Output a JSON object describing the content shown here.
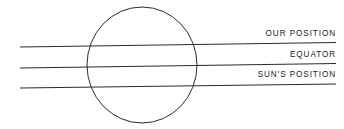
{
  "diagram": {
    "type": "astronomy-schematic",
    "background_color": "#ffffff",
    "stroke_color": "#2b2b2b",
    "text_color": "#222222",
    "width": 344,
    "height": 129,
    "earth_circle": {
      "name": "earth",
      "center_x": 142,
      "center_y": 65,
      "radius_x": 55,
      "radius_y": 58,
      "stroke_width": 1
    },
    "lines": [
      {
        "id": "our-position-line",
        "label": "OUR POSITION",
        "x1": 20,
        "y1": 47,
        "x2": 336,
        "y2": 42.5,
        "stroke_width": 1.2
      },
      {
        "id": "equator-line",
        "label": "EQUATOR",
        "x1": 20,
        "y1": 68,
        "x2": 336,
        "y2": 63.5,
        "stroke_width": 1.2
      },
      {
        "id": "suns-position-line",
        "label": "SUN'S POSITION",
        "x1": 20,
        "y1": 88,
        "x2": 336,
        "y2": 84,
        "stroke_width": 1.2
      }
    ],
    "labels": {
      "our_position": "OUR POSITION",
      "equator": "EQUATOR",
      "suns_position": "SUN'S POSITION"
    }
  }
}
